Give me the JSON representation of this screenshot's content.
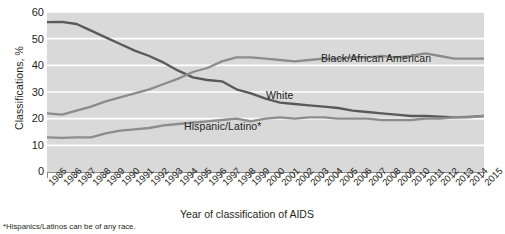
{
  "chart_data": {
    "type": "line",
    "title": "",
    "xlabel": "Year of classification of AIDS",
    "ylabel": "Classifications, %",
    "ylim": [
      0,
      60
    ],
    "yticks": [
      0,
      10,
      20,
      30,
      40,
      50,
      60
    ],
    "grid": true,
    "legend_position": "inline-annotations",
    "footnote": "*Hispanics/Latinos can be of any race.",
    "categories": [
      "1985",
      "1986",
      "1987",
      "1988",
      "1989",
      "1990",
      "1991",
      "1992",
      "1993",
      "1994",
      "1995",
      "1996",
      "1997",
      "1998",
      "1999",
      "2000",
      "2001",
      "2002",
      "2003",
      "2004",
      "2005",
      "2006",
      "2007",
      "2008",
      "2009",
      "2010",
      "2011",
      "2012",
      "2013",
      "2014",
      "2015"
    ],
    "series": [
      {
        "name": "White",
        "color": "#595959",
        "values": [
          56.2,
          56.3,
          55.5,
          53.0,
          50.5,
          48.0,
          45.5,
          43.5,
          41.0,
          38.0,
          35.5,
          34.5,
          34.0,
          31.0,
          29.5,
          27.5,
          26.0,
          25.5,
          25.0,
          24.5,
          24.0,
          23.0,
          22.5,
          22.0,
          21.5,
          21.0,
          21.0,
          20.8,
          20.5,
          20.7,
          21.0
        ]
      },
      {
        "name": "Black/African American",
        "color": "#8c8c8c",
        "values": [
          22.0,
          21.5,
          23.0,
          24.5,
          26.5,
          28.0,
          29.5,
          31.0,
          33.0,
          35.0,
          37.5,
          39.0,
          41.5,
          43.0,
          43.0,
          42.5,
          42.0,
          41.5,
          42.0,
          42.5,
          42.5,
          43.0,
          43.0,
          43.5,
          43.0,
          43.5,
          44.5,
          43.5,
          42.5,
          42.5,
          42.5
        ]
      },
      {
        "name": "Hispanic/Latino*",
        "color": "#8c8c8c",
        "values": [
          13.0,
          12.8,
          13.0,
          13.0,
          14.5,
          15.5,
          16.0,
          16.5,
          17.5,
          18.0,
          18.5,
          19.0,
          19.5,
          20.0,
          19.0,
          20.0,
          20.5,
          20.0,
          20.5,
          20.5,
          20.0,
          20.0,
          20.0,
          19.5,
          19.5,
          19.5,
          20.0,
          20.0,
          20.5,
          20.5,
          21.0
        ]
      }
    ],
    "annotations": [
      {
        "text": "Black/African American",
        "series": "Black/African American"
      },
      {
        "text": "White",
        "series": "White"
      },
      {
        "text": "Hispanic/Latino*",
        "series": "Hispanic/Latino*"
      }
    ]
  },
  "colors": {
    "plot_background": "#d9d9d9",
    "gridline": "#ffffff",
    "page_background": "#ffffff",
    "text": "#231f20",
    "line_dark": "#595959",
    "line_light": "#8c8c8c"
  }
}
